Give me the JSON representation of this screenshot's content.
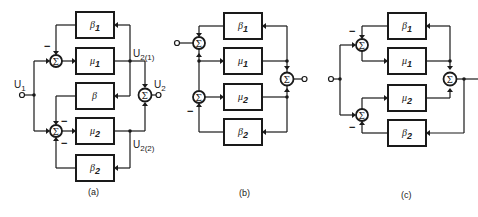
{
  "figure": {
    "panels": [
      {
        "id": "a",
        "caption": "(a)",
        "blocks": [
          "β1",
          "μ1",
          "β",
          "μ2",
          "β2"
        ],
        "signals": {
          "input": "U1",
          "output": "U2",
          "branch_1": "U2(1)",
          "branch_2": "U2(2)"
        },
        "summing_junctions": 3,
        "summing_symbol": "Σ",
        "negative_sign": "−"
      },
      {
        "id": "b",
        "caption": "(b)",
        "blocks": [
          "β1",
          "μ1",
          "μ2",
          "β2"
        ],
        "summing_junctions": 3,
        "summing_symbol": "Σ",
        "negative_sign": "−"
      },
      {
        "id": "c",
        "caption": "(c)",
        "blocks": [
          "β1",
          "μ1",
          "μ2",
          "β2"
        ],
        "summing_junctions": 3,
        "summing_symbol": "Σ",
        "negative_sign": "−"
      }
    ]
  },
  "labels": {
    "beta": "β",
    "mu": "μ",
    "sub1": "1",
    "sub2": "2",
    "U": "U",
    "U1_sub": "1",
    "U2_sub": "2",
    "U21_sub": "2(1)",
    "U22_sub": "2(2)",
    "sigma": "Σ",
    "minus": "−",
    "cap_a": "(a)",
    "cap_b": "(b)",
    "cap_c": "(c)"
  }
}
